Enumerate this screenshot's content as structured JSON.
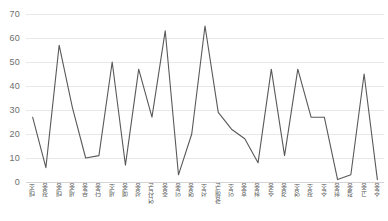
{
  "chart_data": {
    "type": "line",
    "title": "",
    "subtitle": "",
    "xlabel": "",
    "ylabel": "",
    "ylim": [
      0,
      70
    ],
    "ytick_step": 10,
    "yticks": [
      70,
      60,
      50,
      40,
      30,
      20,
      10,
      0
    ],
    "grid": true,
    "legend": false,
    "legend_position": "none",
    "line_color": "#595959",
    "categories": [
      "태조",
      "정종",
      "태종",
      "세종",
      "문종",
      "단종",
      "세조",
      "예종",
      "성종",
      "연산군",
      "중종",
      "인종",
      "명종",
      "선조",
      "광해군",
      "인조",
      "효종",
      "현종",
      "숙종",
      "경종",
      "영조",
      "정조",
      "순조",
      "헌종",
      "철종",
      "고종",
      "순종"
    ],
    "values": [
      27,
      6,
      57,
      31,
      10,
      11,
      50,
      7,
      47,
      27,
      63,
      3,
      20,
      65,
      29,
      22,
      18,
      8,
      47,
      11,
      47,
      27,
      27,
      1,
      3,
      45,
      1
    ],
    "series": [
      {
        "name": "",
        "values": [
          27,
          6,
          57,
          31,
          10,
          11,
          50,
          7,
          47,
          27,
          63,
          3,
          20,
          65,
          29,
          22,
          18,
          8,
          47,
          11,
          47,
          27,
          27,
          1,
          3,
          45,
          1
        ]
      }
    ]
  },
  "colors": {
    "line": "#595959",
    "grid": "#e8e8e8",
    "axis": "#d4d4d4",
    "tick_text": "#6e6e6e",
    "background": "#ffffff"
  }
}
